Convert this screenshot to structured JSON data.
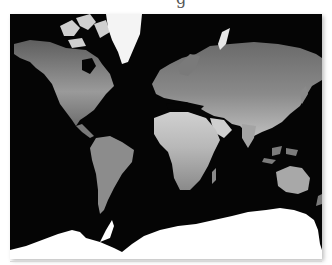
{
  "figure": {
    "type": "world-map",
    "projection": "mercator",
    "style": "grayscale satellite land-cover",
    "caption_fragment": "g",
    "colors": {
      "ocean": "#050505",
      "ice": "#ffffff",
      "land_dark": "#6a6a6a",
      "land_mid": "#8f8f8f",
      "land_light": "#c4c4c4"
    },
    "regions": [
      {
        "name": "north-america"
      },
      {
        "name": "greenland"
      },
      {
        "name": "south-america"
      },
      {
        "name": "europe-asia"
      },
      {
        "name": "africa"
      },
      {
        "name": "australia"
      },
      {
        "name": "antarctica"
      }
    ]
  }
}
